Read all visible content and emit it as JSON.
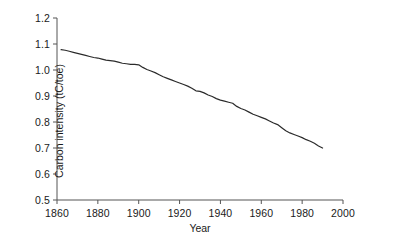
{
  "chart_data": {
    "type": "line",
    "title": "",
    "xlabel": "Year",
    "ylabel": "Carbon intensity (tC/toe)",
    "xlim": [
      1860,
      2000
    ],
    "ylim": [
      0.5,
      1.2
    ],
    "xticks": [
      1860,
      1880,
      1900,
      1920,
      1940,
      1960,
      1980,
      2000
    ],
    "xtick_labels": [
      "1860",
      "1880",
      "1900",
      "1920",
      "1940",
      "1960",
      "1980",
      "2000"
    ],
    "yticks": [
      0.5,
      0.6,
      0.7,
      0.8,
      0.9,
      1.0,
      1.1,
      1.2
    ],
    "ytick_labels": [
      "0.5",
      "0.6",
      "0.7",
      "0.8",
      "0.9",
      "1.0",
      "1.1",
      "1.2"
    ],
    "grid": false,
    "legend": false,
    "line_color": "#2b2b2b",
    "line_width": 1.2,
    "axis_color": "#555555",
    "background": "#ffffff",
    "series": [
      {
        "name": "Carbon intensity",
        "x": [
          1862,
          1864,
          1866,
          1868,
          1870,
          1872,
          1874,
          1876,
          1878,
          1880,
          1882,
          1884,
          1886,
          1888,
          1890,
          1892,
          1894,
          1896,
          1898,
          1900,
          1902,
          1904,
          1906,
          1908,
          1910,
          1912,
          1914,
          1916,
          1918,
          1920,
          1922,
          1924,
          1926,
          1928,
          1930,
          1932,
          1934,
          1936,
          1938,
          1940,
          1942,
          1944,
          1946,
          1948,
          1950,
          1952,
          1954,
          1956,
          1958,
          1960,
          1962,
          1964,
          1966,
          1968,
          1970,
          1972,
          1974,
          1976,
          1978,
          1980,
          1982,
          1984,
          1986,
          1988,
          1990
        ],
        "values": [
          1.078,
          1.076,
          1.072,
          1.068,
          1.064,
          1.06,
          1.056,
          1.052,
          1.048,
          1.046,
          1.042,
          1.038,
          1.036,
          1.034,
          1.03,
          1.026,
          1.024,
          1.022,
          1.022,
          1.02,
          1.01,
          1.002,
          0.996,
          0.99,
          0.982,
          0.974,
          0.968,
          0.962,
          0.956,
          0.95,
          0.944,
          0.938,
          0.93,
          0.92,
          0.918,
          0.912,
          0.904,
          0.898,
          0.89,
          0.884,
          0.88,
          0.876,
          0.872,
          0.86,
          0.852,
          0.846,
          0.838,
          0.83,
          0.824,
          0.818,
          0.812,
          0.804,
          0.796,
          0.79,
          0.778,
          0.766,
          0.758,
          0.752,
          0.746,
          0.74,
          0.732,
          0.726,
          0.718,
          0.708,
          0.7
        ]
      }
    ]
  },
  "axis_titles": {
    "x": "Year",
    "y": "Carbon intensity (tC/toe)"
  }
}
